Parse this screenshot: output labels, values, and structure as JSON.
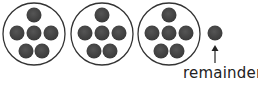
{
  "diagram": {
    "groups": [
      {
        "count": 6
      },
      {
        "count": 6
      },
      {
        "count": 6
      }
    ],
    "remainder": {
      "count": 1,
      "label": "remainder"
    },
    "colors": {
      "dot": "#444444",
      "circle_stroke": "#333333",
      "text": "#222222"
    }
  }
}
